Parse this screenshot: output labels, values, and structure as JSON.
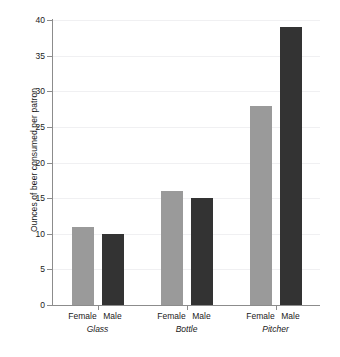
{
  "chart_data": {
    "type": "bar",
    "title": "",
    "xlabel": "",
    "ylabel": "Ounces of beer consumed per patron",
    "ylim": [
      0,
      40
    ],
    "ytick_values": [
      0,
      5,
      10,
      15,
      20,
      25,
      30,
      35,
      40
    ],
    "ytick_labels": [
      "0",
      "5",
      "10",
      "15",
      "20",
      "25",
      "30",
      "35",
      "40"
    ],
    "grid": true,
    "legend": "none",
    "categories": [
      "Glass",
      "Bottle",
      "Pitcher"
    ],
    "subcategories": [
      "Female",
      "Male"
    ],
    "series": [
      {
        "name": "Female",
        "color": "#9a9a9a",
        "values": [
          11,
          16,
          28
        ]
      },
      {
        "name": "Male",
        "color": "#333333",
        "values": [
          10,
          15,
          39
        ]
      }
    ],
    "bars": [
      {
        "group": "Glass",
        "sex": "Female",
        "value": 11,
        "color": "#9a9a9a"
      },
      {
        "group": "Glass",
        "sex": "Male",
        "value": 10,
        "color": "#333333"
      },
      {
        "group": "Bottle",
        "sex": "Female",
        "value": 16,
        "color": "#9a9a9a"
      },
      {
        "group": "Bottle",
        "sex": "Male",
        "value": 15,
        "color": "#333333"
      },
      {
        "group": "Pitcher",
        "sex": "Female",
        "value": 28,
        "color": "#9a9a9a"
      },
      {
        "group": "Pitcher",
        "sex": "Male",
        "value": 39,
        "color": "#333333"
      }
    ],
    "axis_color": "#8c8c8c",
    "gridline_color": "#f0f0f2",
    "background": "#ffffff"
  }
}
